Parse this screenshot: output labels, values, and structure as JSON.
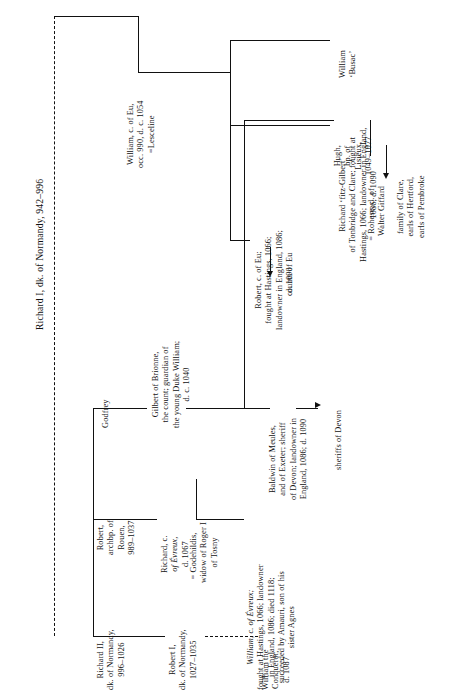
{
  "plate": {
    "type": "genealogical-family-tree",
    "orientation": "text-rotated-90-ccw",
    "root_label": "Richard I, dk. of Normandy, 942–996"
  },
  "nodes": {
    "root": {
      "id": "richard-i",
      "lines": [
        "Richard I, dk. of Normandy, 942–996"
      ]
    },
    "richard_ii": {
      "id": "richard-ii",
      "lines": [
        "Richard II,",
        "dk. of Normandy,",
        "996–1026"
      ]
    },
    "robert_archbp": {
      "id": "robert-archbishop-rouen",
      "lines": [
        "Robert,",
        "archbp. of",
        "Rouen,",
        "989–1037"
      ]
    },
    "godfrey": {
      "id": "godfrey",
      "lines": [
        "Godfrey"
      ]
    },
    "william_eu": {
      "id": "william-count-of-eu",
      "lines": [
        "William, c. of Eu,",
        "occ. 990, d. c. 1054"
      ],
      "spouse_marker": "=",
      "spouse": "Lesceline"
    },
    "robert_i_normandy": {
      "id": "robert-i-normandy",
      "lines": [
        "Robert I,",
        "dk. of Normandy,",
        "1027–1035"
      ]
    },
    "william_conqueror": {
      "id": "william-the-conqueror",
      "lines": [
        "William the",
        "Conqueror,",
        "d. 1087"
      ]
    },
    "richard_evreux": {
      "id": "richard-count-of-evreux",
      "lines": [
        "Richard, c.",
        "of Évreux,",
        "d. 1067"
      ],
      "spouse_marker": "=",
      "spouse_lines": [
        "Godehildis,",
        "widow of Roger I",
        "of Tosny"
      ]
    },
    "william_evreux": {
      "id": "william-count-of-evreux",
      "lines": [
        "William, c. of Évreux;",
        "fought at Hastings, 1066; landowner",
        "in England, 1086; died 1118;",
        "succeeded by Amauri, son of his",
        "sister Agnes"
      ]
    },
    "gilbert_brionne": {
      "id": "gilbert-of-brionne",
      "lines": [
        "Gilbert of Brionne,",
        "the count; guardian of",
        "the young Duke William;",
        "d. c. 1040"
      ]
    },
    "robert_eu": {
      "id": "robert-count-of-eu",
      "lines": [
        "Robert, c. of Eu;",
        "fought at Hastings, 1066;",
        "landowner in England, 1086;",
        "d. 1090"
      ]
    },
    "counts_of_eu": {
      "id": "counts-of-eu",
      "lines": [
        "counts of Eu"
      ]
    },
    "baldwin_meules": {
      "id": "baldwin-of-meules",
      "lines": [
        "Baldwin of Meules,",
        "and of Exeter; sheriff",
        "of Devon; landowner in",
        "England, 1086; d. 1090"
      ]
    },
    "sheriffs_of_devon": {
      "id": "sheriffs-of-devon",
      "lines": [
        "sheriffs of Devon"
      ]
    },
    "hugh_lisieux": {
      "id": "hugh-bishop-of-lisieux",
      "lines": [
        "Hugh,",
        "bp. of",
        "Lisieux,",
        "1049–1077"
      ]
    },
    "william_busac": {
      "id": "william-busac",
      "lines": [
        "William",
        "‘Busac’"
      ]
    },
    "richard_fitz_gilbert": {
      "id": "richard-fitz-gilbert",
      "lines": [
        "Richard ‘fitz-Gilbert’",
        "of Tonbridge and Clare; fought at",
        "Hastings, 1066; landowner in England,",
        "1086; d. 1090"
      ],
      "spouse_marker": "=",
      "spouse_lines": [
        "Rohese, d. of",
        "Walter Giffard"
      ]
    },
    "clare_family": {
      "id": "family-of-clare",
      "lines": [
        "family of Clare,",
        "earls of Hertford,",
        "earls of Pembroke"
      ]
    }
  },
  "colors": {
    "ink": "#111111",
    "paper": "#ffffff"
  }
}
